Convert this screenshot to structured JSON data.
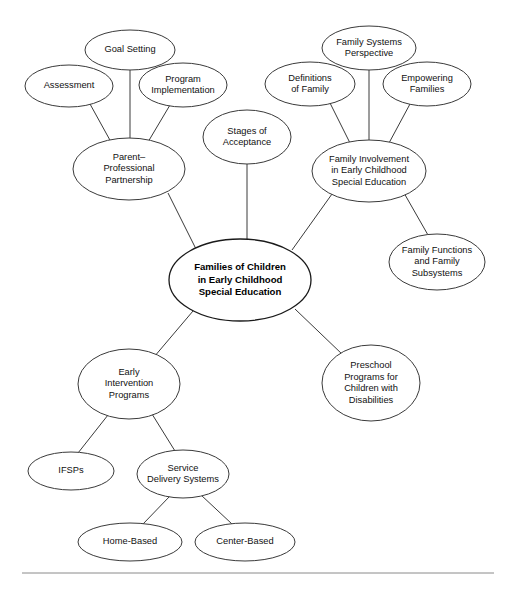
{
  "diagram": {
    "type": "concept-map",
    "canvas": {
      "width": 511,
      "height": 595
    },
    "style": {
      "node_fill": "#ffffff",
      "node_stroke": "#3a3a3a",
      "edge_stroke": "#3a3a3a",
      "text_color": "#111111",
      "rule_color": "#8a8a8a"
    },
    "nodes": [
      {
        "id": "central",
        "lines": [
          "Families of Children",
          "in Early Childhood",
          "Special Education"
        ],
        "cx": 240,
        "cy": 280,
        "rx": 71,
        "ry": 41,
        "bold": true
      },
      {
        "id": "parent-professional-partnership",
        "lines": [
          "Parent–",
          "Professional",
          "Partnership"
        ],
        "cx": 129,
        "cy": 169,
        "rx": 56,
        "ry": 31,
        "bold": false
      },
      {
        "id": "goal-setting",
        "lines": [
          "Goal Setting"
        ],
        "cx": 130,
        "cy": 50,
        "rx": 45,
        "ry": 20,
        "bold": false
      },
      {
        "id": "assessment",
        "lines": [
          "Assessment"
        ],
        "cx": 69,
        "cy": 86,
        "rx": 44,
        "ry": 21,
        "bold": false
      },
      {
        "id": "program-implementation",
        "lines": [
          "Program",
          "Implementation"
        ],
        "cx": 183,
        "cy": 85,
        "rx": 44,
        "ry": 22,
        "bold": false
      },
      {
        "id": "stages-of-acceptance",
        "lines": [
          "Stages of",
          "Acceptance"
        ],
        "cx": 247,
        "cy": 137,
        "rx": 44,
        "ry": 27,
        "bold": false
      },
      {
        "id": "family-involvement",
        "lines": [
          "Family Involvement",
          "in Early Childhood",
          "Special Education"
        ],
        "cx": 369,
        "cy": 171,
        "rx": 57,
        "ry": 31,
        "bold": false
      },
      {
        "id": "family-systems-perspective",
        "lines": [
          "Family Systems",
          "Perspective"
        ],
        "cx": 369,
        "cy": 48,
        "rx": 47,
        "ry": 22,
        "bold": false
      },
      {
        "id": "definitions-of-family",
        "lines": [
          "Definitions",
          "of Family"
        ],
        "cx": 310,
        "cy": 84,
        "rx": 45,
        "ry": 22,
        "bold": false
      },
      {
        "id": "empowering-families",
        "lines": [
          "Empowering",
          "Families"
        ],
        "cx": 427,
        "cy": 84,
        "rx": 44,
        "ry": 22,
        "bold": false
      },
      {
        "id": "family-functions-and-subsystems",
        "lines": [
          "Family Functions",
          "and Family",
          "Subsystems"
        ],
        "cx": 437,
        "cy": 262,
        "rx": 48,
        "ry": 28,
        "bold": false
      },
      {
        "id": "early-intervention-programs",
        "lines": [
          "Early",
          "Intervention",
          "Programs"
        ],
        "cx": 129,
        "cy": 384,
        "rx": 51,
        "ry": 35,
        "bold": false
      },
      {
        "id": "preschool-programs",
        "lines": [
          "Preschool",
          "Programs for",
          "Children with",
          "Disabilities"
        ],
        "cx": 371,
        "cy": 383,
        "rx": 49,
        "ry": 38,
        "bold": false
      },
      {
        "id": "ifsps",
        "lines": [
          "IFSPs"
        ],
        "cx": 71,
        "cy": 471,
        "rx": 43,
        "ry": 19,
        "bold": false
      },
      {
        "id": "service-delivery-systems",
        "lines": [
          "Service",
          "Delivery Systems"
        ],
        "cx": 183,
        "cy": 474,
        "rx": 46,
        "ry": 24,
        "bold": false
      },
      {
        "id": "home-based",
        "lines": [
          "Home-Based"
        ],
        "cx": 130,
        "cy": 542,
        "rx": 52,
        "ry": 19,
        "bold": false
      },
      {
        "id": "center-based",
        "lines": [
          "Center-Based"
        ],
        "cx": 245,
        "cy": 542,
        "rx": 50,
        "ry": 19,
        "bold": false
      }
    ],
    "edges": [
      {
        "id": "edge-goal-setting",
        "from": "goal-setting",
        "to": "parent-professional-partnership",
        "x1": 130,
        "y1": 70,
        "x2": 130,
        "y2": 140
      },
      {
        "id": "edge-assessment",
        "from": "assessment",
        "to": "parent-professional-partnership",
        "x1": 90,
        "y1": 104,
        "x2": 111,
        "y2": 142
      },
      {
        "id": "edge-program-implementation",
        "from": "program-implementation",
        "to": "parent-professional-partnership",
        "x1": 170,
        "y1": 105,
        "x2": 148,
        "y2": 142
      },
      {
        "id": "edge-partnership-central",
        "from": "parent-professional-partnership",
        "to": "central",
        "x1": 168,
        "y1": 193,
        "x2": 197,
        "y2": 251
      },
      {
        "id": "edge-stages-central",
        "from": "stages-of-acceptance",
        "to": "central",
        "x1": 247,
        "y1": 164,
        "x2": 247,
        "y2": 239
      },
      {
        "id": "edge-family-systems",
        "from": "family-systems-perspective",
        "to": "family-involvement",
        "x1": 369,
        "y1": 70,
        "x2": 369,
        "y2": 141
      },
      {
        "id": "edge-definitions",
        "from": "definitions-of-family",
        "to": "family-involvement",
        "x1": 330,
        "y1": 103,
        "x2": 350,
        "y2": 143
      },
      {
        "id": "edge-empowering",
        "from": "empowering-families",
        "to": "family-involvement",
        "x1": 410,
        "y1": 104,
        "x2": 389,
        "y2": 143
      },
      {
        "id": "edge-involvement-central",
        "from": "family-involvement",
        "to": "central",
        "x1": 332,
        "y1": 194,
        "x2": 292,
        "y2": 250
      },
      {
        "id": "edge-involvement-functions",
        "from": "family-involvement",
        "to": "family-functions-and-subsystems",
        "x1": 404,
        "y1": 193,
        "x2": 428,
        "y2": 235
      },
      {
        "id": "edge-central-early-intervention",
        "from": "central",
        "to": "early-intervention-programs",
        "x1": 193,
        "y1": 311,
        "x2": 154,
        "y2": 357
      },
      {
        "id": "edge-central-preschool",
        "from": "central",
        "to": "preschool-programs",
        "x1": 295,
        "y1": 309,
        "x2": 343,
        "y2": 355
      },
      {
        "id": "edge-early-ifsps",
        "from": "early-intervention-programs",
        "to": "ifsps",
        "x1": 108,
        "y1": 415,
        "x2": 78,
        "y2": 453
      },
      {
        "id": "edge-early-service",
        "from": "early-intervention-programs",
        "to": "service-delivery-systems",
        "x1": 152,
        "y1": 414,
        "x2": 175,
        "y2": 451
      },
      {
        "id": "edge-service-home",
        "from": "service-delivery-systems",
        "to": "home-based",
        "x1": 170,
        "y1": 496,
        "x2": 143,
        "y2": 524
      },
      {
        "id": "edge-service-center",
        "from": "service-delivery-systems",
        "to": "center-based",
        "x1": 201,
        "y1": 495,
        "x2": 232,
        "y2": 524
      }
    ],
    "bottom_rule": {
      "x1": 22,
      "y1": 573,
      "x2": 494,
      "y2": 573
    }
  }
}
